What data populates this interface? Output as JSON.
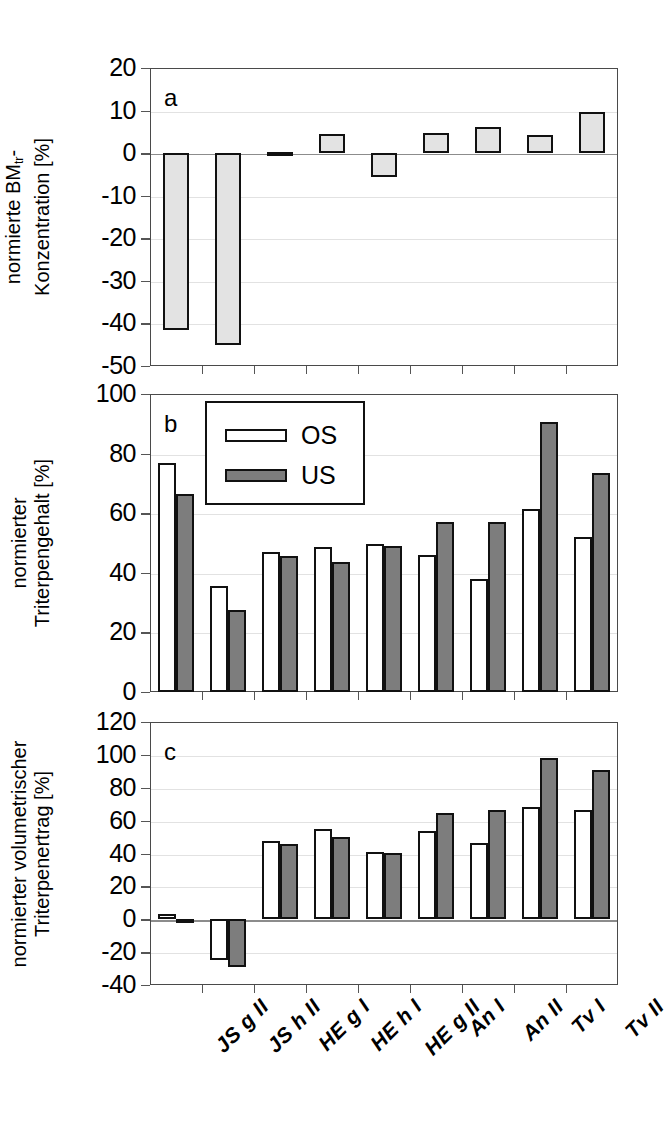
{
  "figure": {
    "width": 657,
    "height": 1147,
    "background": "#ffffff",
    "series_colors": {
      "single": "#e3e3e3",
      "os": "#ffffff",
      "us": "#7d7d7d",
      "outline": "#111111"
    }
  },
  "categories": [
    "JS g II",
    "JS h II",
    "HE g I",
    "HE h I",
    "HE g II",
    "An I",
    "An II",
    "Tv I",
    "Tv II"
  ],
  "legend": {
    "position": "top-left-inside-panel-b",
    "entries": [
      {
        "key": "os",
        "label": "OS",
        "fill": "#ffffff"
      },
      {
        "key": "us",
        "label": "US",
        "fill": "#7d7d7d"
      }
    ]
  },
  "panels": [
    {
      "id": "a",
      "letter": "a",
      "ytitle_line1": "normierte BM",
      "ytitle_sub": "tr",
      "ytitle_line1_tail": "-",
      "ytitle_line2": "Konzentration [%]",
      "yticks": [
        20,
        10,
        0,
        -10,
        -20,
        -30,
        -40,
        -50
      ],
      "ylim": [
        -50,
        20
      ]
    },
    {
      "id": "b",
      "letter": "b",
      "ytitle_line1": "normierter",
      "ytitle_line2": "Triterpengehalt [%]",
      "yticks": [
        100,
        80,
        60,
        40,
        20,
        0
      ],
      "ylim": [
        0,
        100
      ]
    },
    {
      "id": "c",
      "letter": "c",
      "ytitle_line1": "normierter volumetrischer",
      "ytitle_line2": "Triterpenertrag [%]",
      "yticks": [
        120,
        100,
        80,
        60,
        40,
        20,
        0,
        -20,
        -40
      ],
      "ylim": [
        -40,
        120
      ]
    }
  ],
  "chart_data": [
    {
      "type": "bar",
      "panel": "a",
      "title": "",
      "xlabel": "",
      "ylabel": "normierte BMtr-Konzentration [%]",
      "categories": [
        "JS g II",
        "JS h II",
        "HE g I",
        "HE h I",
        "HE g II",
        "An I",
        "An II",
        "Tv I",
        "Tv II"
      ],
      "values": [
        -41.5,
        -45.0,
        0.3,
        4.5,
        -5.5,
        4.8,
        6.2,
        4.2,
        9.7
      ],
      "ylim": [
        -50,
        20
      ],
      "yticks": [
        -50,
        -40,
        -30,
        -20,
        -10,
        0,
        10,
        20
      ],
      "grid": true,
      "legend": "none"
    },
    {
      "type": "bar",
      "panel": "b",
      "title": "",
      "xlabel": "",
      "ylabel": "normierter Triterpengehalt [%]",
      "categories": [
        "JS g II",
        "JS h II",
        "HE g I",
        "HE h I",
        "HE g II",
        "An I",
        "An II",
        "Tv I",
        "Tv II"
      ],
      "series": [
        {
          "name": "OS",
          "values": [
            77.0,
            35.5,
            47.0,
            48.5,
            49.5,
            46.0,
            38.0,
            61.5,
            52.0
          ]
        },
        {
          "name": "US",
          "values": [
            66.5,
            27.5,
            45.5,
            43.5,
            49.0,
            57.0,
            57.0,
            90.5,
            73.5
          ]
        }
      ],
      "ylim": [
        0,
        100
      ],
      "yticks": [
        0,
        20,
        40,
        60,
        80,
        100
      ],
      "grid": true,
      "legend": "top-left"
    },
    {
      "type": "bar",
      "panel": "c",
      "title": "",
      "xlabel": "",
      "ylabel": "normierter volumetrischer Triterpenertrag [%]",
      "categories": [
        "JS g II",
        "JS h II",
        "HE g I",
        "HE h I",
        "HE g II",
        "An I",
        "An II",
        "Tv I",
        "Tv II"
      ],
      "series": [
        {
          "name": "OS",
          "values": [
            3.0,
            -25.0,
            47.5,
            55.0,
            41.0,
            53.5,
            46.5,
            68.5,
            66.5
          ]
        },
        {
          "name": "US",
          "values": [
            -2.0,
            -29.0,
            45.5,
            50.0,
            40.5,
            64.5,
            66.5,
            98.0,
            90.5
          ]
        }
      ],
      "ylim": [
        -40,
        120
      ],
      "yticks": [
        -40,
        -20,
        0,
        20,
        40,
        60,
        80,
        100,
        120
      ],
      "grid": true,
      "legend": "none"
    }
  ]
}
